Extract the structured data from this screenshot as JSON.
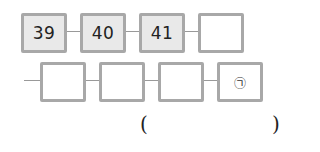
{
  "row1": {
    "boxes": [
      {
        "value": "39",
        "filled": true
      },
      {
        "value": "40",
        "filled": true
      },
      {
        "value": "41",
        "filled": true
      },
      {
        "value": "",
        "filled": false
      }
    ]
  },
  "row2": {
    "boxes": [
      {
        "value": "",
        "filled": false
      },
      {
        "value": "",
        "filled": false
      },
      {
        "value": "",
        "filled": false
      },
      {
        "value": "㉠",
        "filled": false
      }
    ]
  },
  "answer": {
    "open_paren": "(",
    "close_paren": ")",
    "value": ""
  },
  "colors": {
    "box_border": "#a8a8a8",
    "box_fill": "#e9e9e9",
    "connector": "#999999"
  }
}
